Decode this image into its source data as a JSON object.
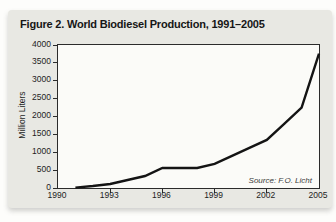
{
  "figure": {
    "title": "Figure 2. World Biodiesel Production, 1991–2005",
    "source": "Source: F.O. Licht"
  },
  "chart_data": {
    "type": "line",
    "title": "Figure 2. World Biodiesel Production, 1991–2005",
    "x": [
      1991,
      1992,
      1993,
      1994,
      1995,
      1996,
      1997,
      1998,
      1999,
      2000,
      2001,
      2002,
      2003,
      2004,
      2005
    ],
    "values": [
      11,
      56,
      112,
      224,
      336,
      560,
      560,
      560,
      673,
      897,
      1122,
      1346,
      1795,
      2245,
      3760
    ],
    "xlabel": "",
    "ylabel": "Million Liters",
    "xlim": [
      1990,
      2005
    ],
    "ylim": [
      0,
      4000
    ],
    "x_ticks": [
      1990,
      1993,
      1996,
      1999,
      2002,
      2005
    ],
    "y_ticks": [
      0,
      500,
      1000,
      1500,
      2000,
      2500,
      3000,
      3500,
      4000
    ],
    "grid": false,
    "legend": "none",
    "annotation": "Source: F.O. Licht"
  },
  "colors": {
    "page_bg": "#fdfdfb",
    "panel_bg": "#e8e8e3",
    "plot_bg": "#fbfbf8",
    "axis_border": "#2b2b2b",
    "line": "#141414",
    "text": "#1d1d1d",
    "source_text": "#3c3c3c"
  }
}
